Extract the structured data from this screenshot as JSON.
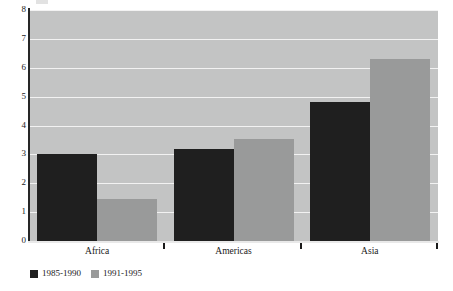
{
  "chart_data": {
    "type": "bar",
    "title": "",
    "subtitle": "",
    "xlabel": "",
    "ylabel": "",
    "categories": [
      "Africa",
      "Americas",
      "Asia"
    ],
    "series": [
      {
        "name": "1985-1990",
        "color": "#1f1f1f",
        "values": [
          3.0,
          3.2,
          4.8
        ]
      },
      {
        "name": "1991-1995",
        "color": "#999a9a",
        "values": [
          1.45,
          3.55,
          6.3
        ]
      }
    ],
    "ylim": [
      0,
      8
    ],
    "yticks": [
      0,
      1,
      2,
      3,
      4,
      5,
      6,
      7,
      8
    ],
    "ytick_labels": [
      "0",
      "1",
      "2",
      "3",
      "4",
      "5",
      "6",
      "7",
      "8"
    ],
    "grid": true,
    "grid_color": "#f2f2f2",
    "plot_background": "#c3c4c4",
    "legend_position": "bottom-left",
    "legend": [
      "1985-1990",
      "1991-1995"
    ]
  }
}
